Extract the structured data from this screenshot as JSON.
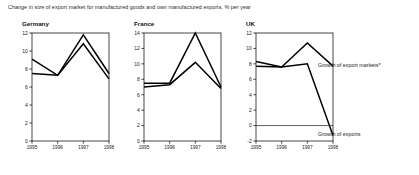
{
  "figure": {
    "title": "Change in size of export market for manufactured goods and own manufactured exports, % per year"
  },
  "legend": {
    "markets_label": "Growth of export markets*",
    "exports_label": "Growth of exports"
  },
  "panels": [
    {
      "title": "Germany"
    },
    {
      "title": "France"
    },
    {
      "title": "UK"
    }
  ],
  "chart_data": [
    {
      "type": "line",
      "title": "Germany",
      "xlabel": "",
      "ylabel": "",
      "x": [
        "1995",
        "1996",
        "1997",
        "1998"
      ],
      "categories": [
        "1995",
        "1996",
        "1997",
        "1998"
      ],
      "ylim": [
        0,
        12
      ],
      "yticks": [
        0,
        2,
        4,
        6,
        8,
        10,
        12
      ],
      "grid": false,
      "legend_position": "right-outside",
      "series": [
        {
          "name": "Growth of export markets*",
          "values": [
            7.5,
            7.3,
            11.8,
            7.5
          ]
        },
        {
          "name": "Growth of exports",
          "values": [
            9.1,
            7.3,
            10.8,
            6.9
          ]
        }
      ]
    },
    {
      "type": "line",
      "title": "France",
      "xlabel": "",
      "ylabel": "",
      "x": [
        "1995",
        "1996",
        "1997",
        "1998"
      ],
      "categories": [
        "1995",
        "1996",
        "1997",
        "1998"
      ],
      "ylim": [
        0,
        14
      ],
      "yticks": [
        0,
        2,
        4,
        6,
        8,
        10,
        12,
        14
      ],
      "grid": false,
      "legend_position": "right-outside",
      "series": [
        {
          "name": "Growth of export markets*",
          "values": [
            7.5,
            7.5,
            14.0,
            7.0
          ]
        },
        {
          "name": "Growth of exports",
          "values": [
            7.0,
            7.3,
            10.2,
            6.8
          ]
        }
      ]
    },
    {
      "type": "line",
      "title": "UK",
      "xlabel": "",
      "ylabel": "",
      "x": [
        "1995",
        "1996",
        "1997",
        "1998"
      ],
      "categories": [
        "1995",
        "1996",
        "1997",
        "1998"
      ],
      "ylim": [
        -2,
        12
      ],
      "yticks": [
        -2,
        0,
        2,
        4,
        6,
        8,
        10,
        12
      ],
      "grid": false,
      "legend_position": "right-outside",
      "series": [
        {
          "name": "Growth of export markets*",
          "values": [
            7.7,
            7.6,
            10.7,
            7.7
          ]
        },
        {
          "name": "Growth of exports",
          "values": [
            8.3,
            7.6,
            8.0,
            -1.3
          ]
        }
      ]
    }
  ],
  "axis": {
    "germany_yticks": [
      "0",
      "2",
      "4",
      "6",
      "8",
      "10",
      "12"
    ],
    "france_yticks": [
      "0",
      "2",
      "4",
      "6",
      "8",
      "10",
      "12",
      "14"
    ],
    "uk_yticks": [
      "-2",
      "0",
      "2",
      "4",
      "6",
      "8",
      "10",
      "12"
    ],
    "xticks": [
      "1995",
      "1996",
      "1997",
      "1998"
    ]
  },
  "colors": {
    "line": "#000000",
    "axis": "#1a1a1a",
    "text": "#222222",
    "background": "#ffffff"
  }
}
